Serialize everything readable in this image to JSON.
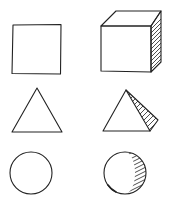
{
  "diagram": {
    "colors": {
      "stroke": "#222222",
      "background": "#ffffff"
    },
    "rows": [
      {
        "flat": "square",
        "solid": "cube"
      },
      {
        "flat": "triangle",
        "solid": "pyramid"
      },
      {
        "flat": "circle",
        "solid": "sphere"
      }
    ]
  }
}
